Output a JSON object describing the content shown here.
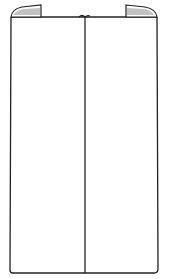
{
  "illustration": {
    "subject": "folded panel line drawing",
    "stroke_color": "#222222",
    "background_color": "#ffffff",
    "fold_shading_color": "#9a9a9a"
  }
}
